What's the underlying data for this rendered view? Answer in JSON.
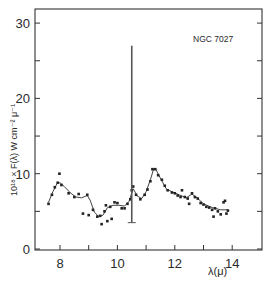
{
  "chart_data": {
    "type": "scatter",
    "title": "",
    "annotation": "NGC 7027",
    "xlabel": "λ(μ)",
    "ylabel": "10¹⁸ × F(λ)   W cm⁻² μ⁻¹",
    "xlim": [
      7.1,
      15.0
    ],
    "ylim": [
      0,
      32
    ],
    "x_ticks": [
      8,
      9,
      10,
      11,
      12,
      13,
      14
    ],
    "x_tick_labels": [
      "8",
      "",
      "10",
      "",
      "12",
      "",
      "14"
    ],
    "y_ticks": [
      0,
      5,
      10,
      15,
      20,
      25,
      30
    ],
    "y_tick_labels": [
      "0",
      "",
      "10",
      "",
      "20",
      "",
      "30"
    ],
    "grid": false,
    "legend": "none",
    "series": [
      {
        "name": "observed points",
        "kind": "scatter",
        "points": [
          [
            7.6,
            6.0
          ],
          [
            7.72,
            7.2
          ],
          [
            7.82,
            8.2
          ],
          [
            7.92,
            8.8
          ],
          [
            7.98,
            10.0
          ],
          [
            8.05,
            8.5
          ],
          [
            8.3,
            7.4
          ],
          [
            8.5,
            6.9
          ],
          [
            8.65,
            7.3
          ],
          [
            8.8,
            4.7
          ],
          [
            8.95,
            7.2
          ],
          [
            9.0,
            4.5
          ],
          [
            9.15,
            5.2
          ],
          [
            9.3,
            4.3
          ],
          [
            9.4,
            4.4
          ],
          [
            9.45,
            3.3
          ],
          [
            9.55,
            5.0
          ],
          [
            9.6,
            5.8
          ],
          [
            9.65,
            3.7
          ],
          [
            9.75,
            5.6
          ],
          [
            9.8,
            4.0
          ],
          [
            9.9,
            6.2
          ],
          [
            10.0,
            6.1
          ],
          [
            10.15,
            5.4
          ],
          [
            10.25,
            5.4
          ],
          [
            10.35,
            6.0
          ],
          [
            10.45,
            6.6
          ],
          [
            10.5,
            7.8
          ],
          [
            10.55,
            8.3
          ],
          [
            10.65,
            7.2
          ],
          [
            10.8,
            6.6
          ],
          [
            10.95,
            7.2
          ],
          [
            11.05,
            7.9
          ],
          [
            11.15,
            9.0
          ],
          [
            11.22,
            10.6
          ],
          [
            11.32,
            10.6
          ],
          [
            11.42,
            9.8
          ],
          [
            11.55,
            9.2
          ],
          [
            11.65,
            8.4
          ],
          [
            11.75,
            7.8
          ],
          [
            11.9,
            7.5
          ],
          [
            12.0,
            7.4
          ],
          [
            12.1,
            7.1
          ],
          [
            12.2,
            6.9
          ],
          [
            12.25,
            7.8
          ],
          [
            12.35,
            6.9
          ],
          [
            12.45,
            6.7
          ],
          [
            12.5,
            6.0
          ],
          [
            12.6,
            7.4
          ],
          [
            12.7,
            6.9
          ],
          [
            12.8,
            6.7
          ],
          [
            12.9,
            6.1
          ],
          [
            13.0,
            5.9
          ],
          [
            13.1,
            5.6
          ],
          [
            13.2,
            5.5
          ],
          [
            13.3,
            5.2
          ],
          [
            13.35,
            4.3
          ],
          [
            13.4,
            5.4
          ],
          [
            13.5,
            5.0
          ],
          [
            13.6,
            4.6
          ],
          [
            13.7,
            6.2
          ],
          [
            13.75,
            6.4
          ],
          [
            13.8,
            4.7
          ],
          [
            13.85,
            5.1
          ]
        ]
      },
      {
        "name": "fitted curve",
        "kind": "line",
        "points": [
          [
            7.6,
            6.2
          ],
          [
            7.75,
            7.6
          ],
          [
            7.9,
            8.7
          ],
          [
            8.0,
            8.8
          ],
          [
            8.15,
            8.3
          ],
          [
            8.35,
            7.5
          ],
          [
            8.55,
            6.9
          ],
          [
            8.75,
            6.8
          ],
          [
            8.95,
            7.1
          ],
          [
            9.05,
            6.5
          ],
          [
            9.2,
            4.9
          ],
          [
            9.35,
            4.3
          ],
          [
            9.5,
            4.5
          ],
          [
            9.65,
            5.5
          ],
          [
            9.85,
            5.8
          ],
          [
            10.05,
            5.8
          ],
          [
            10.25,
            5.7
          ],
          [
            10.4,
            6.3
          ],
          [
            10.55,
            8.0
          ],
          [
            10.7,
            7.0
          ],
          [
            10.85,
            6.7
          ],
          [
            11.0,
            7.6
          ],
          [
            11.15,
            9.2
          ],
          [
            11.27,
            10.7
          ],
          [
            11.35,
            10.5
          ],
          [
            11.5,
            9.4
          ],
          [
            11.7,
            8.0
          ],
          [
            11.9,
            7.6
          ],
          [
            12.15,
            7.2
          ],
          [
            12.4,
            6.8
          ],
          [
            12.6,
            7.3
          ],
          [
            12.8,
            6.7
          ],
          [
            13.0,
            6.0
          ],
          [
            13.3,
            5.5
          ],
          [
            13.6,
            5.2
          ],
          [
            13.85,
            5.2
          ]
        ]
      },
      {
        "name": "vertical bar",
        "kind": "errorbar",
        "x": 10.5,
        "y_low": 3.5,
        "y_high": 27.0
      }
    ]
  }
}
